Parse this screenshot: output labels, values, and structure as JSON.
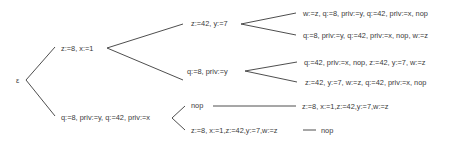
{
  "tree": {
    "root": {
      "label": "ε"
    },
    "level1": [
      {
        "id": "a",
        "label": "z:=8, x:=1"
      },
      {
        "id": "b",
        "label": "q:=8, priv:=y, q:=42, priv:=x"
      }
    ],
    "level2": [
      {
        "id": "a1",
        "parent": "a",
        "label": "z:=42, y:=7"
      },
      {
        "id": "a2",
        "parent": "a",
        "label": "q:=8, priv:=y"
      },
      {
        "id": "b1",
        "parent": "b",
        "label": "nop"
      },
      {
        "id": "b2",
        "parent": "b",
        "label": "z:=8, x:=1,z:=42,y:=7,w:=z"
      }
    ],
    "leaves": [
      {
        "id": "a1a",
        "parent": "a1",
        "label": "w:=z, q:=8, priv:=y, q:=42, priv:=x, nop"
      },
      {
        "id": "a1b",
        "parent": "a1",
        "label": "q:=8, priv:=y, q:=42, priv:=x, nop, w:=z"
      },
      {
        "id": "a2a",
        "parent": "a2",
        "label": "q:=42, priv:=x, nop, z:=42, y:=7, w:=z"
      },
      {
        "id": "a2b",
        "parent": "a2",
        "label": "z:=42, y:=7, w:=z, q:=42, priv:=x, nop"
      },
      {
        "id": "b1a",
        "parent": "b1",
        "label": "z:=8, x:=1,z:=42,y:=7,w:=z"
      },
      {
        "id": "b2a",
        "parent": "b2",
        "label": "nop"
      }
    ]
  }
}
